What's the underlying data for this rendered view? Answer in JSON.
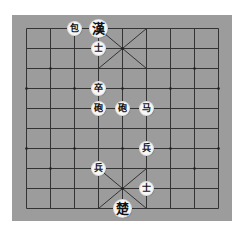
{
  "board": {
    "background": "#9c9c9c",
    "line_color": "#333333",
    "columns": 9,
    "rows": 10,
    "origin_x": 26,
    "origin_y": 28,
    "col_spacing": 24,
    "row_spacing": 20
  },
  "pieces": [
    {
      "name": "black-cannon",
      "label": "包",
      "col": 2,
      "row": 0,
      "king": false
    },
    {
      "name": "black-king",
      "label": "漢",
      "col": 3,
      "row": 0,
      "king": true
    },
    {
      "name": "black-advisor",
      "label": "士",
      "col": 3,
      "row": 1,
      "king": false
    },
    {
      "name": "black-soldier",
      "label": "卒",
      "col": 3,
      "row": 3,
      "king": false
    },
    {
      "name": "cannon-1",
      "label": "砲",
      "col": 3,
      "row": 4,
      "king": false
    },
    {
      "name": "cannon-2",
      "label": "砲",
      "col": 4,
      "row": 4,
      "king": false
    },
    {
      "name": "horse",
      "label": "马",
      "col": 5,
      "row": 4,
      "king": false
    },
    {
      "name": "red-soldier-1",
      "label": "兵",
      "col": 5,
      "row": 6,
      "king": false
    },
    {
      "name": "red-soldier-2",
      "label": "兵",
      "col": 3,
      "row": 7,
      "king": false
    },
    {
      "name": "red-advisor",
      "label": "士",
      "col": 5,
      "row": 8,
      "king": false
    },
    {
      "name": "red-king",
      "label": "楚",
      "col": 4,
      "row": 9,
      "king": true
    }
  ]
}
